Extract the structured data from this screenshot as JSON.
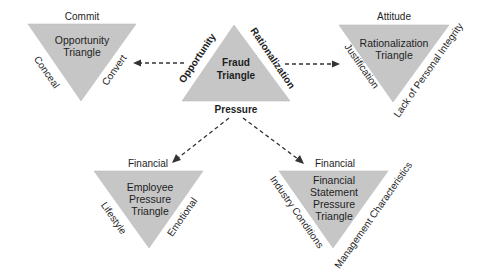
{
  "colors": {
    "triangle_fill": "#c6c6c6",
    "text": "#1e1e1e",
    "arrow": "#333333",
    "background": "#ffffff"
  },
  "center": {
    "title_line1": "Fraud",
    "title_line2": "Triangle",
    "left_side": "Opportunity",
    "right_side": "Rationalization",
    "bottom": "Pressure"
  },
  "opportunity": {
    "title_line1": "Opportunity",
    "title_line2": "Triangle",
    "top": "Commit",
    "left_side": "Conceal",
    "right_side": "Convert"
  },
  "rationalization": {
    "title_line1": "Rationalization",
    "title_line2": "Triangle",
    "top": "Attitude",
    "left_side": "Justification",
    "right_side": "Lack of Personal Integrity"
  },
  "employee_pressure": {
    "title_line1": "Employee",
    "title_line2": "Pressure",
    "title_line3": "Triangle",
    "top": "Financial",
    "left_side": "Lifestyle",
    "right_side": "Emotional"
  },
  "financial_statement_pressure": {
    "title_line1": "Financial",
    "title_line2": "Statement",
    "title_line3": "Pressure",
    "title_line4": "Triangle",
    "top": "Financial",
    "left_side": "Industry Conditions",
    "right_side": "Management Characteristics"
  },
  "connections": [
    {
      "from": "Fraud Triangle (Opportunity)",
      "to": "Opportunity Triangle"
    },
    {
      "from": "Fraud Triangle (Rationalization)",
      "to": "Rationalization Triangle"
    },
    {
      "from": "Fraud Triangle (Pressure)",
      "to": "Employee Pressure Triangle"
    },
    {
      "from": "Fraud Triangle (Pressure)",
      "to": "Financial Statement Pressure Triangle"
    }
  ]
}
